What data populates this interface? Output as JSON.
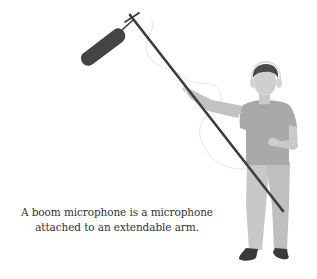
{
  "caption": {
    "line1": "A boom microphone is a microphone",
    "line2": "attached to an extendable arm."
  },
  "illustration": {
    "subject": "person holding boom microphone",
    "icons": [
      "boom-microphone-icon",
      "person-figure-icon",
      "headphones-icon"
    ]
  },
  "colors": {
    "background": "#ffffff",
    "pole": "#3d3d3d",
    "mic": "#444444",
    "skin": "#cfcfcf",
    "hair": "#4a4a4a",
    "shirt": "#a9a9a9",
    "pants": "#c4c4c4",
    "shoes": "#3a3a3a",
    "cable": "#e6e6e6",
    "text": "#333333"
  }
}
